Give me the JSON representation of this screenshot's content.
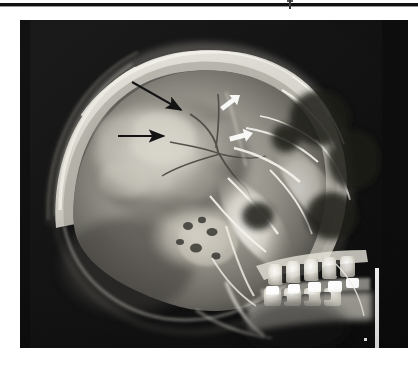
{
  "page": {
    "background_color": "#ffffff",
    "width": 418,
    "height": 368
  },
  "top_rule": {
    "name": "horizontal-rule",
    "color": "#111111",
    "y": 3,
    "thickness": 3,
    "tick_mark": {
      "label": "",
      "x": 289,
      "description": "small vertical registration tick on rule"
    }
  },
  "figure": {
    "type": "radiograph",
    "modality": "X-ray",
    "view": "lateral skull",
    "frame": {
      "x": 20,
      "y": 20,
      "width": 388,
      "height": 328
    },
    "background_color": "#121212",
    "bone_color": "#e8e6e0",
    "soft_tissue_color": "#6f6d68",
    "caption": "",
    "alt_text": "Lateral skull radiograph showing the cranial vault, facial bones, maxillary and mandibular dentition with radiopaque dental restorations, and a vertical radiopaque film marker at the right margin."
  },
  "annotations": {
    "black_arrows": [
      {
        "id": "black-arrow-upper",
        "color": "#131313",
        "tail": {
          "x": 112,
          "y": 62
        },
        "head": {
          "x": 163,
          "y": 91
        },
        "direction": "down-right",
        "points_to": "lucent line in parietal region"
      },
      {
        "id": "black-arrow-lower",
        "color": "#131313",
        "tail": {
          "x": 98,
          "y": 116
        },
        "head": {
          "x": 146,
          "y": 116
        },
        "direction": "right",
        "points_to": "second lucent line in parietal region"
      }
    ],
    "white_arrows": [
      {
        "id": "white-arrow-upper",
        "color": "#f7f7f5",
        "tail": {
          "x": 240,
          "y": 60
        },
        "head": {
          "x": 220,
          "y": 75
        },
        "direction": "down-left",
        "points_to": "coronal suture margin"
      },
      {
        "id": "white-arrow-lower",
        "color": "#f7f7f5",
        "tail": {
          "x": 256,
          "y": 107
        },
        "head": {
          "x": 233,
          "y": 113
        },
        "direction": "left",
        "points_to": "lower coronal suture margin"
      }
    ]
  },
  "film_marker": {
    "name": "radiopaque-film-marker",
    "color": "#f2f2f0",
    "x": 355,
    "y": 248,
    "width": 4,
    "height": 95,
    "dot": {
      "x": 344,
      "y": 318,
      "size": 3
    }
  },
  "anatomy_labels": {
    "cranial_vault": "cranial vault",
    "frontal_bone": "frontal bone",
    "occipital_bone": "occipital bone",
    "mastoid": "mastoid air cells",
    "maxillary_teeth": "maxillary dentition",
    "mandibular_teeth": "mandibular dentition",
    "dental_restorations": "radiopaque dental restorations",
    "mandible": "mandible",
    "sella_region": "sella / skull base"
  },
  "chart_data": {
    "type": "heatmap",
    "title": "",
    "xlabel": "",
    "ylabel": "",
    "note": "Greyscale radiographic image — no plotted numeric series."
  }
}
